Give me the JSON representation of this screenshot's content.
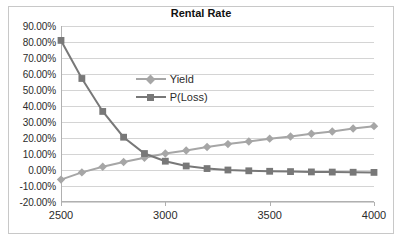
{
  "chart_data": {
    "type": "line",
    "title": "Rental Rate",
    "xlabel": "",
    "ylabel": "",
    "xlim": [
      2500,
      4000
    ],
    "ylim": [
      -0.2,
      0.9
    ],
    "grid": true,
    "legend_position": "inside-upper-center",
    "x": [
      2500,
      2600,
      2700,
      2800,
      2900,
      3000,
      3100,
      3200,
      3300,
      3400,
      3500,
      3600,
      3700,
      3800,
      3900,
      4000
    ],
    "xticks": [
      2500,
      3000,
      3500,
      4000
    ],
    "xtick_labels": [
      "2500",
      "3000",
      "3500",
      "4000"
    ],
    "yticks": [
      0.9,
      0.8,
      0.7,
      0.6,
      0.5,
      0.4,
      0.3,
      0.2,
      0.1,
      0.0,
      -0.1,
      -0.2
    ],
    "ytick_labels": [
      "90.00%",
      "80.00%",
      "70.00%",
      "60.00%",
      "50.00%",
      "40.00%",
      "30.00%",
      "20.00%",
      "10.00%",
      "0.00%",
      "-10.00%",
      "-20.00%"
    ],
    "series": [
      {
        "name": "Yield",
        "color": "#a6a6a6",
        "marker": "diamond",
        "values": [
          -0.06,
          -0.015,
          0.02,
          0.05,
          0.077,
          0.103,
          0.122,
          0.144,
          0.162,
          0.178,
          0.196,
          0.209,
          0.227,
          0.241,
          0.259,
          0.274
        ]
      },
      {
        "name": "P(Loss)",
        "color": "#787878",
        "marker": "square",
        "values": [
          0.81,
          0.572,
          0.366,
          0.205,
          0.103,
          0.055,
          0.025,
          0.009,
          0.0,
          -0.005,
          -0.008,
          -0.01,
          -0.012,
          -0.013,
          -0.014,
          -0.015
        ]
      }
    ]
  },
  "legend": {
    "items": [
      {
        "label": "Yield"
      },
      {
        "label": "P(Loss)"
      }
    ]
  },
  "colors": {
    "yield": "#a6a6a6",
    "p_loss": "#787878",
    "grid": "#d4d4d4",
    "axis": "#b0b0b0",
    "frame": "#c8c8c8",
    "text": "#2b2b2b"
  }
}
